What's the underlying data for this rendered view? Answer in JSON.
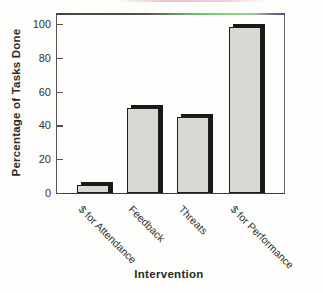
{
  "figure": {
    "background": "#fdfdfb",
    "scan_artifacts": {
      "top_pink_line_color": "#eeb8ca",
      "frame_green_tint": "#6cc46c",
      "frame_purple_tint": "#6f5f86"
    }
  },
  "chart_data": {
    "type": "bar",
    "title": "",
    "categories": [
      "$ for Attendance",
      "Feedback",
      "Threats",
      "$ for Performance"
    ],
    "values": [
      5,
      50,
      45,
      98
    ],
    "xlabel": "Intervention",
    "ylabel": "Percentage of Tasks Done",
    "ylim": [
      0,
      100
    ],
    "yticks": [
      0,
      20,
      40,
      60,
      80,
      100
    ],
    "grid": false,
    "legend": false,
    "bar_fill": "#d9d9d4",
    "bar_outline": "#1e1e1c",
    "bar_shadow": "#181816",
    "label_rotation_deg": 45
  }
}
